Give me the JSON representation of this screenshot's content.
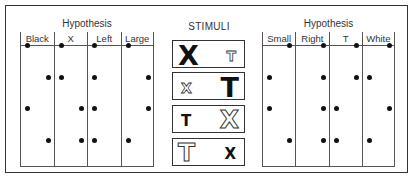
{
  "left_panel": {
    "title": "Hypothesis",
    "columns": [
      "Black",
      "X",
      "Left",
      "Large"
    ],
    "dots": [
      [
        "left",
        "left",
        "left",
        "left"
      ],
      [
        "right",
        "left",
        "left",
        "right"
      ],
      [
        "left",
        "right",
        "left",
        "right"
      ],
      [
        "right",
        "right",
        "left",
        "left"
      ]
    ]
  },
  "stimuli": {
    "title": "STIMULI",
    "rows": [
      {
        "left": {
          "glyph": "X",
          "style": "black-big"
        },
        "right": {
          "glyph": "T",
          "style": "white-small"
        }
      },
      {
        "left": {
          "glyph": "X",
          "style": "white-small"
        },
        "right": {
          "glyph": "T",
          "style": "black-big"
        }
      },
      {
        "left": {
          "glyph": "T",
          "style": "black-small"
        },
        "right": {
          "glyph": "X",
          "style": "white-big"
        }
      },
      {
        "left": {
          "glyph": "T",
          "style": "white-big"
        },
        "right": {
          "glyph": "X",
          "style": "black-small"
        }
      }
    ]
  },
  "right_panel": {
    "title": "Hypothesis",
    "columns": [
      "Small",
      "Right",
      "T",
      "White"
    ],
    "dots": [
      [
        "right",
        "right",
        "right",
        "right"
      ],
      [
        "left",
        "right",
        "right",
        "left"
      ],
      [
        "left",
        "right",
        "left",
        "right"
      ],
      [
        "right",
        "right",
        "left",
        "left"
      ]
    ]
  }
}
